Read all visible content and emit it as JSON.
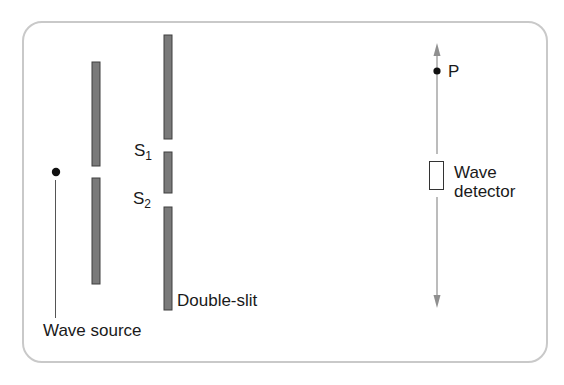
{
  "diagram": {
    "labels": {
      "wave_source": "Wave source",
      "double_slit": "Double-slit",
      "slit1_base": "S",
      "slit1_sub": "1",
      "slit2_base": "S",
      "slit2_sub": "2",
      "point_p": "P",
      "detector_line1": "Wave",
      "detector_line2": "detector"
    },
    "colors": {
      "frame_border": "#c9c9c9",
      "barrier_fill": "#7a7a7a",
      "barrier_stroke": "#3f3f3f",
      "arrow": "#8f8f8f",
      "dot": "#111111",
      "leader_line": "#555555",
      "text": "#1a1a1a"
    },
    "elements": {
      "source_dot": {
        "cx": 56,
        "cy": 172,
        "r": 4
      },
      "single_slit_barrier": [
        {
          "x": 92,
          "y": 62,
          "w": 8,
          "h": 104
        },
        {
          "x": 92,
          "y": 178,
          "w": 8,
          "h": 106
        }
      ],
      "double_slit_barrier": [
        {
          "x": 164,
          "y": 35,
          "w": 8,
          "h": 104
        },
        {
          "x": 164,
          "y": 152,
          "w": 8,
          "h": 41
        },
        {
          "x": 164,
          "y": 207,
          "w": 8,
          "h": 103
        }
      ],
      "screen_axis": {
        "x": 437,
        "y_top": 43,
        "y_bottom": 308
      },
      "point_p": {
        "cx": 437,
        "cy": 71,
        "r": 3.5
      },
      "detector": {
        "x": 429,
        "y": 161,
        "w": 15,
        "h": 29
      }
    }
  }
}
